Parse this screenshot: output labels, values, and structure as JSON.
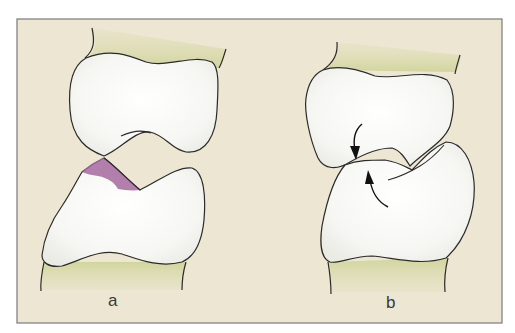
{
  "figure": {
    "colors": {
      "background": "#ece6d3",
      "frame": "#7a7a7a",
      "shaft": "#d9dcae",
      "bone": "#f7f7f4",
      "outline": "#2a2a2a",
      "cartilage_wear": "#a66aa0"
    },
    "panels": [
      {
        "id": "a",
        "label": "a",
        "description": "Joint with tilted surfaces; purple shaded contact/wear zone on lower bone"
      },
      {
        "id": "b",
        "label": "b",
        "description": "Joint with opposing rotation arrows indicating rotational subluxation"
      }
    ]
  }
}
